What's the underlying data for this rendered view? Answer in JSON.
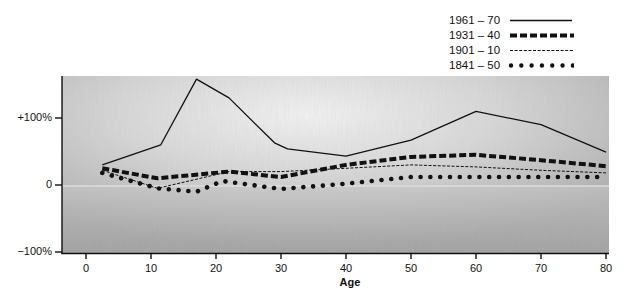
{
  "chart_data": {
    "type": "line",
    "title": "",
    "xlabel": "Age",
    "ylabel": "",
    "x_ticks": [
      0,
      10,
      20,
      30,
      40,
      50,
      60,
      70,
      80
    ],
    "y_ticks": [
      {
        "value": 100,
        "label": "+100%"
      },
      {
        "value": 0,
        "label": "0"
      },
      {
        "value": -100,
        "label": "−100%"
      }
    ],
    "xlim": [
      -4,
      80.5
    ],
    "ylim": [
      -100,
      162
    ],
    "grid": false,
    "legend_position": "top-right",
    "series": [
      {
        "name": "1961 – 70",
        "style": "solid-thin",
        "x": [
          2.5,
          11.5,
          17,
          22,
          29,
          31,
          40,
          50,
          60,
          70,
          80
        ],
        "y": [
          30,
          60,
          158,
          130,
          63,
          54,
          43,
          67,
          110,
          90,
          49
        ]
      },
      {
        "name": "1931 – 40",
        "style": "dashed-thick",
        "x": [
          2.5,
          11,
          22,
          30,
          40,
          50,
          60,
          70,
          80
        ],
        "y": [
          25,
          10,
          20,
          12,
          30,
          42,
          45,
          37,
          28
        ]
      },
      {
        "name": "1901 – 10",
        "style": "dashed-thin",
        "x": [
          2.5,
          11,
          22,
          30,
          40,
          50,
          60,
          70,
          80
        ],
        "y": [
          22,
          -5,
          20,
          20,
          25,
          30,
          27,
          22,
          18
        ]
      },
      {
        "name": "1841 – 50",
        "style": "dotted-thick",
        "x": [
          2.5,
          11,
          17,
          21,
          30,
          40,
          50,
          60,
          70,
          80
        ],
        "y": [
          18,
          -5,
          -10,
          6,
          -6,
          2,
          12,
          12,
          12,
          12
        ]
      }
    ]
  },
  "legend": {
    "items": [
      {
        "label": "1961 – 70"
      },
      {
        "label": "1931 – 40"
      },
      {
        "label": "1901 – 10"
      },
      {
        "label": "1841 – 50"
      }
    ]
  },
  "axes": {
    "x_tick_labels": [
      "0",
      "10",
      "20",
      "30",
      "40",
      "50",
      "60",
      "70",
      "80"
    ],
    "y_tick_labels": [
      "+100%",
      "0",
      "−100%"
    ],
    "x_title": "Age"
  },
  "colors": {
    "ink": "#111111",
    "plot_bg_light": "#f2f2f2",
    "plot_bg_mid": "#d4d4d4",
    "plot_bg_dark": "#a9a9a9"
  }
}
